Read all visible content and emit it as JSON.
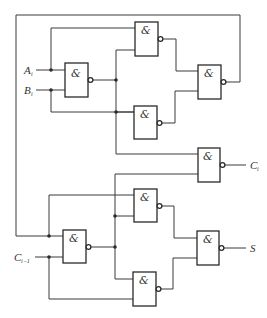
{
  "diagram": {
    "type": "logic-circuit",
    "gate_symbol": "&",
    "inputs": {
      "a": {
        "label": "A",
        "subscript": "i"
      },
      "b": {
        "label": "B",
        "subscript": "i"
      },
      "cin": {
        "label": "C",
        "subscript": "i−1"
      }
    },
    "outputs": {
      "carry": {
        "label": "C",
        "subscript": "i"
      },
      "sum": {
        "label": "S",
        "subscript": ""
      }
    },
    "gates": [
      {
        "id": "G1",
        "symbol": "&",
        "inverted_output": true
      },
      {
        "id": "G2",
        "symbol": "&",
        "inverted_output": true
      },
      {
        "id": "G3",
        "symbol": "&",
        "inverted_output": true
      },
      {
        "id": "G4",
        "symbol": "&",
        "inverted_output": true
      },
      {
        "id": "G5",
        "symbol": "&",
        "inverted_output": true
      },
      {
        "id": "G6",
        "symbol": "&",
        "inverted_output": true
      },
      {
        "id": "G7",
        "symbol": "&",
        "inverted_output": true
      },
      {
        "id": "G8",
        "symbol": "&",
        "inverted_output": true
      },
      {
        "id": "G9",
        "symbol": "&",
        "inverted_output": true
      }
    ],
    "colors": {
      "line": "#2a2a2a",
      "background": "#ffffff"
    }
  }
}
